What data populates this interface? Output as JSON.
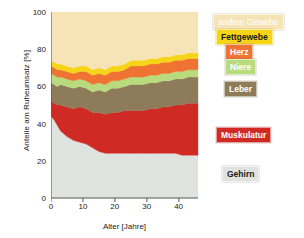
{
  "chart_data": {
    "type": "area",
    "stacked": true,
    "title": "",
    "xlabel": "Alter [Jahre]",
    "ylabel": "Anteile am Ruheumsatz [%]",
    "xlim": [
      0,
      46
    ],
    "ylim": [
      0,
      100
    ],
    "xticks": [
      0,
      10,
      20,
      30,
      40
    ],
    "yticks": [
      0,
      20,
      40,
      60,
      80,
      100
    ],
    "grid": false,
    "legend_position": "right-inline",
    "x": [
      0,
      1,
      2,
      3,
      5,
      7,
      9,
      11,
      13,
      15,
      17,
      19,
      21,
      23,
      25,
      27,
      29,
      31,
      33,
      35,
      37,
      39,
      41,
      43,
      45,
      46
    ],
    "series": [
      {
        "name": "Gehirn",
        "color": "#dfe3e0",
        "values": [
          44,
          42,
          39,
          36,
          33,
          31,
          30,
          29,
          27,
          25,
          24,
          24,
          24,
          24,
          24,
          24,
          24,
          24,
          24,
          24,
          24,
          24,
          23,
          23,
          23,
          23
        ]
      },
      {
        "name": "Muskulatur",
        "color": "#cf2b24",
        "values": [
          8,
          9,
          11,
          14,
          16,
          17,
          19,
          19,
          19,
          21,
          21,
          22,
          22,
          23,
          23,
          23,
          23,
          24,
          24,
          25,
          25,
          26,
          27,
          28,
          28,
          28
        ]
      },
      {
        "name": "Leber",
        "color": "#8d7b5a",
        "values": [
          10,
          10,
          10,
          11,
          11,
          11,
          11,
          11,
          11,
          12,
          12,
          13,
          13,
          13,
          14,
          14,
          14,
          14,
          14,
          14,
          14,
          14,
          14,
          14,
          14,
          14
        ]
      },
      {
        "name": "Niere",
        "color": "#bada7e",
        "values": [
          5,
          5,
          5,
          4,
          4,
          4,
          4,
          4,
          4,
          4,
          4,
          4,
          4,
          4,
          4,
          4,
          4,
          4,
          4,
          4,
          4,
          4,
          4,
          4,
          4,
          4
        ]
      },
      {
        "name": "Herz",
        "color": "#ef7333",
        "values": [
          4,
          4,
          4,
          4,
          4,
          4,
          4,
          5,
          5,
          5,
          5,
          5,
          5,
          5,
          6,
          6,
          6,
          6,
          6,
          6,
          6,
          6,
          6,
          6,
          6,
          6
        ]
      },
      {
        "name": "Fettgewebe",
        "color": "#f6d417",
        "values": [
          3,
          3,
          3,
          3,
          3,
          3,
          3,
          3,
          3,
          3,
          3,
          3,
          3,
          3,
          3,
          3,
          3,
          3,
          3,
          3,
          3,
          3,
          3,
          3,
          3,
          3
        ]
      },
      {
        "name": "andere Gewebe",
        "color": "#f7e4b6",
        "values": [
          26,
          27,
          28,
          28,
          29,
          30,
          29,
          29,
          31,
          30,
          31,
          29,
          29,
          28,
          26,
          26,
          26,
          25,
          25,
          24,
          24,
          23,
          23,
          22,
          22,
          22
        ]
      }
    ]
  },
  "axes": {
    "ylabel": "Anteile am Ruheumsatz [%]",
    "xlabel": "Alter [Jahre]",
    "yticks": [
      "0",
      "20",
      "40",
      "60",
      "80",
      "100"
    ],
    "xticks": [
      "0",
      "10",
      "20",
      "30",
      "40"
    ]
  },
  "legend": {
    "andere_gewebe": "andere Gewebe",
    "fettgewebe": "Fettgewebe",
    "herz": "Herz",
    "niere": "Niere",
    "leber": "Leber",
    "muskulatur": "Muskulatur",
    "gehirn": "Gehirn"
  },
  "colors": {
    "gehirn": "#dfe3e0",
    "muskulatur": "#cf2b24",
    "leber": "#8d7b5a",
    "niere": "#bada7e",
    "herz": "#ef7333",
    "fettgewebe": "#f6d417",
    "andere_gewebe": "#f7e4b6",
    "axis": "#58595b",
    "text": "#1a1a1a"
  }
}
